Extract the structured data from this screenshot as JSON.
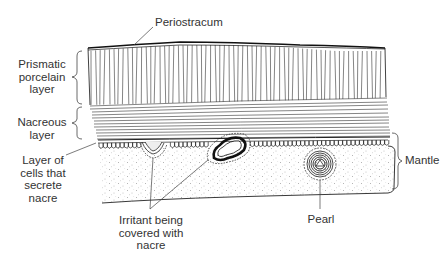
{
  "diagram": {
    "type": "cross-section illustration",
    "colors": {
      "ink": "#222222",
      "text": "#333333",
      "background": "#ffffff"
    },
    "labels": {
      "periostracum": {
        "lines": [
          "Periostracum"
        ]
      },
      "prismatic": {
        "lines": [
          "Prismatic",
          "porcelain",
          "layer"
        ]
      },
      "nacreous": {
        "lines": [
          "Nacreous",
          "layer"
        ]
      },
      "cell_layer": {
        "lines": [
          "Layer of",
          "cells that",
          "secrete",
          "nacre"
        ]
      },
      "irritant": {
        "lines": [
          "Irritant being",
          "covered with",
          "nacre"
        ]
      },
      "pearl": {
        "lines": [
          "Pearl"
        ]
      },
      "mantle": {
        "lines": [
          "Mantle"
        ]
      }
    }
  }
}
